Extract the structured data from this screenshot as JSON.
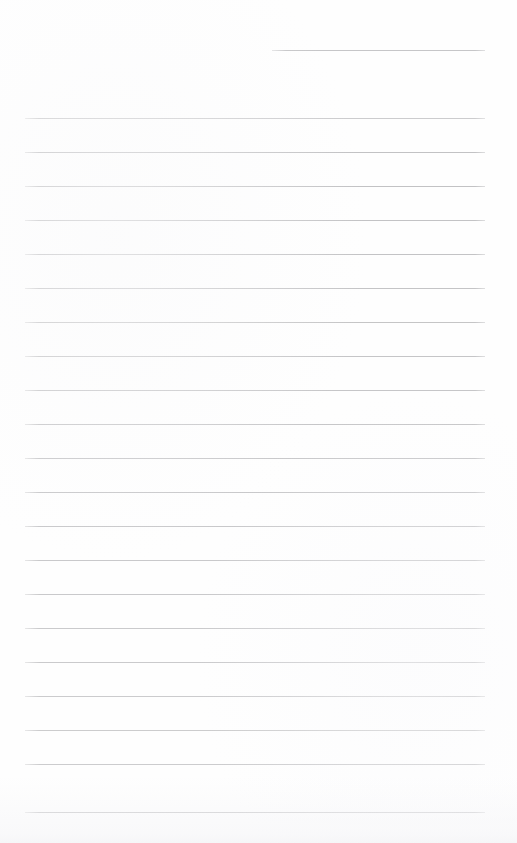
{
  "document": {
    "kind": "ruled-notebook-page",
    "title": "",
    "body_text": "",
    "background_color": "#fefefe",
    "page_width": 517,
    "page_height": 843
  },
  "rules": {
    "line_color": "#c2c2c4",
    "line_thickness_px": 1,
    "line_spacing_px": 34,
    "full_line_left_px": 25,
    "full_line_right_px": 485,
    "first_full_line_y_px": 118,
    "last_full_line_y_px": 812,
    "full_line_count": 21,
    "header_rule": {
      "name": "header-rule",
      "y_px": 50,
      "left_px": 272,
      "right_px": 485,
      "color": "#c6c6c8"
    },
    "lines": [
      {
        "y": 118,
        "left": 25,
        "right": 485
      },
      {
        "y": 152,
        "left": 25,
        "right": 485
      },
      {
        "y": 186,
        "left": 25,
        "right": 485
      },
      {
        "y": 220,
        "left": 25,
        "right": 485
      },
      {
        "y": 254,
        "left": 25,
        "right": 485
      },
      {
        "y": 288,
        "left": 25,
        "right": 485
      },
      {
        "y": 322,
        "left": 25,
        "right": 485
      },
      {
        "y": 356,
        "left": 25,
        "right": 485
      },
      {
        "y": 390,
        "left": 25,
        "right": 485
      },
      {
        "y": 424,
        "left": 25,
        "right": 485
      },
      {
        "y": 458,
        "left": 25,
        "right": 485
      },
      {
        "y": 492,
        "left": 25,
        "right": 485
      },
      {
        "y": 526,
        "left": 25,
        "right": 485
      },
      {
        "y": 560,
        "left": 25,
        "right": 485
      },
      {
        "y": 594,
        "left": 25,
        "right": 485
      },
      {
        "y": 628,
        "left": 25,
        "right": 485
      },
      {
        "y": 662,
        "left": 25,
        "right": 485
      },
      {
        "y": 696,
        "left": 25,
        "right": 485
      },
      {
        "y": 730,
        "left": 25,
        "right": 485
      },
      {
        "y": 764,
        "left": 25,
        "right": 485
      },
      {
        "y": 812,
        "left": 25,
        "right": 485
      }
    ]
  }
}
